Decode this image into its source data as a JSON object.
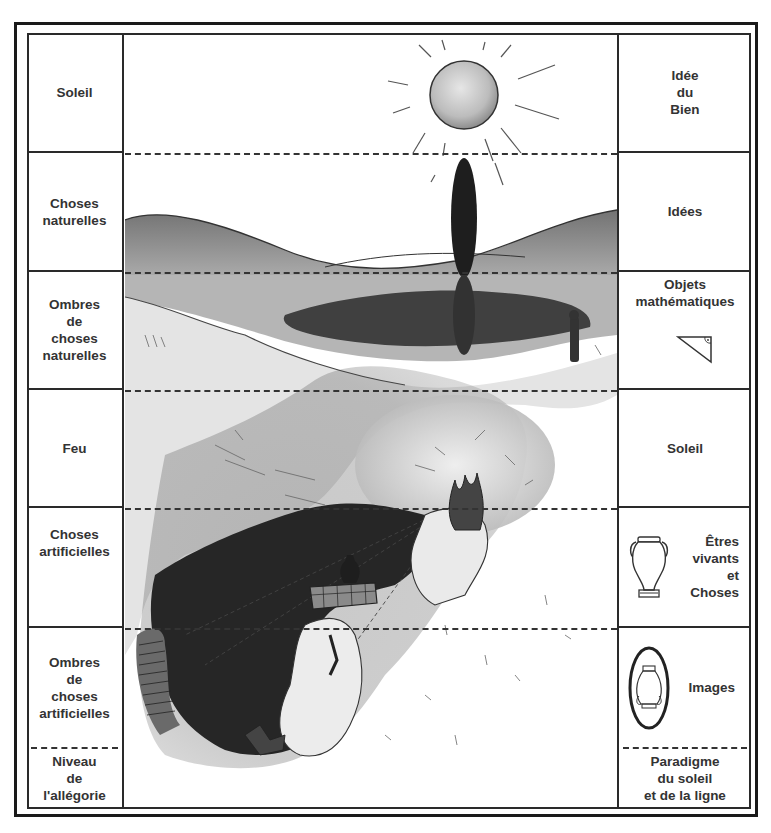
{
  "left_column": {
    "rows": [
      {
        "label": "Soleil"
      },
      {
        "label": "Choses\nnaturelles"
      },
      {
        "label": "Ombres\nde\nchoses\nnaturelles"
      },
      {
        "label": "Feu"
      },
      {
        "label": "Choses\nartificielles"
      },
      {
        "label": "Ombres\nde\nchoses\nartificielles"
      }
    ],
    "footer": "Niveau\nde\nl'allégorie"
  },
  "right_column": {
    "rows": [
      {
        "label": "Idée\ndu\nBien"
      },
      {
        "label": "Idées"
      },
      {
        "label": "Objets\nmathématiques",
        "icon": "right-triangle-icon"
      },
      {
        "label": "Soleil"
      },
      {
        "label": "Êtres\nvivants\net\nChoses",
        "icon": "amphora-icon"
      },
      {
        "label": "Images",
        "icon": "framed-vase-icon"
      }
    ],
    "footer": "Paradigme\ndu soleil\net de la ligne"
  },
  "illustration": {
    "elements": [
      "sun",
      "cypress-tree",
      "reflection-lake",
      "standing-figure",
      "cave",
      "fire",
      "low-wall",
      "vase-on-wall",
      "chained-prisoner",
      "cave-wall-shadows"
    ]
  },
  "colors": {
    "ink": "#2a2a2a",
    "shade_dark": "#2e2e2e",
    "shade_mid": "#8a8a8a",
    "paper": "#ffffff"
  }
}
